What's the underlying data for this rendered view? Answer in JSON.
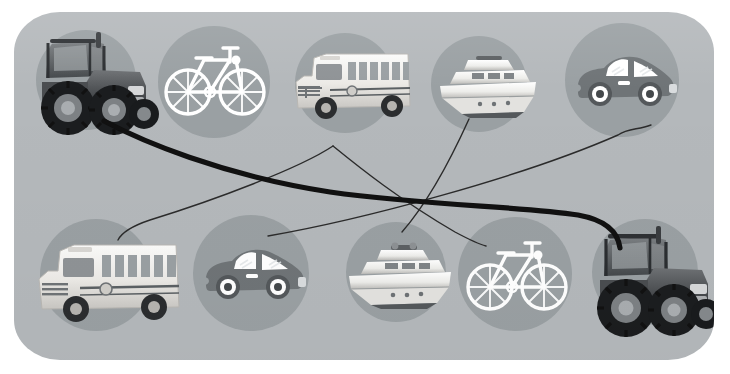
{
  "scene": {
    "title": "Vehicle matching puzzle",
    "canvas_width": 730,
    "canvas_height": 374,
    "background_color": "#ffffff",
    "panel": {
      "color": "#b4b8bb",
      "x": 14,
      "y": 12,
      "width": 700,
      "height": 348,
      "corner_radius": "46px/40px"
    },
    "disc_color": "#9aa0a3",
    "icon_color": "#ffffff",
    "illustration_body_color": "#6f7477",
    "line_color_thin": "#2b2b2b",
    "line_color_thick": "#111111"
  },
  "rows": [
    {
      "name": "top-row",
      "items": [
        {
          "id": "top-1",
          "icon": "tractor-photo",
          "label": "Tractor",
          "style": "photo",
          "cx": 86,
          "cy": 80,
          "r": 50
        },
        {
          "id": "top-2",
          "icon": "bicycle-icon",
          "label": "Bicycle",
          "style": "flat-outline",
          "cx": 214,
          "cy": 82,
          "r": 56
        },
        {
          "id": "top-3",
          "icon": "school-bus-photo",
          "label": "School bus",
          "style": "photo",
          "cx": 345,
          "cy": 83,
          "r": 50
        },
        {
          "id": "top-4",
          "icon": "yacht-photo",
          "label": "Yacht",
          "style": "photo",
          "cx": 479,
          "cy": 84,
          "r": 48
        },
        {
          "id": "top-5",
          "icon": "car-icon",
          "label": "Car",
          "style": "flat-solid",
          "cx": 622,
          "cy": 81,
          "r": 57
        }
      ]
    },
    {
      "name": "bottom-row",
      "items": [
        {
          "id": "bot-1",
          "icon": "school-bus-photo",
          "label": "School bus",
          "style": "photo",
          "cx": 96,
          "cy": 275,
          "r": 56
        },
        {
          "id": "bot-2",
          "icon": "car-icon",
          "label": "Car",
          "style": "flat-solid",
          "cx": 251,
          "cy": 273,
          "r": 58
        },
        {
          "id": "bot-3",
          "icon": "yacht-photo",
          "label": "Yacht",
          "style": "photo",
          "cx": 396,
          "cy": 272,
          "r": 50
        },
        {
          "id": "bot-4",
          "icon": "bicycle-icon",
          "label": "Bicycle",
          "style": "flat-outline",
          "cx": 515,
          "cy": 274,
          "r": 57
        },
        {
          "id": "bot-5",
          "icon": "tractor-photo",
          "label": "Tractor",
          "style": "photo",
          "cx": 645,
          "cy": 272,
          "r": 53
        }
      ]
    }
  ],
  "connections": [
    {
      "id": "link-1",
      "from": "top-1",
      "to": "bot-5",
      "weight": "thick",
      "label": "tractor to tractor"
    },
    {
      "id": "link-2",
      "from": "top-3",
      "to": "bot-1",
      "weight": "thin",
      "label": "school bus to school bus"
    },
    {
      "id": "link-3",
      "from": "top-4",
      "to": "bot-3",
      "weight": "thin",
      "label": "yacht to yacht"
    },
    {
      "id": "link-4",
      "from": "top-5",
      "to": "bot-2",
      "weight": "thin",
      "label": "car to car"
    },
    {
      "id": "link-5",
      "from": "top-2",
      "to": "bot-4",
      "weight": "thin",
      "label": "bicycle to bicycle"
    }
  ]
}
